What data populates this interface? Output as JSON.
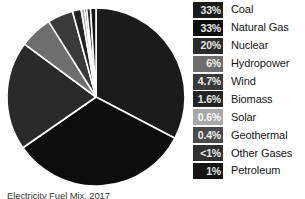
{
  "figure": {
    "caption": "Electricity Fuel Mix, 2017",
    "caption_visible_note": "clipped at image bottom edge"
  },
  "legend": {
    "items": [
      {
        "pct": "33%",
        "label": "Coal",
        "swatch_color": "#1b1b1b",
        "pct_color": "#e8e8e8"
      },
      {
        "pct": "33%",
        "label": "Natural Gas",
        "swatch_color": "#0d0d0d",
        "pct_color": "#ededed"
      },
      {
        "pct": "20%",
        "label": "Nuclear",
        "swatch_color": "#2a2a2a",
        "pct_color": "#e4e4e4"
      },
      {
        "pct": "6%",
        "label": "Hydropower",
        "swatch_color": "#6e6e6e",
        "pct_color": "#f2f2f2"
      },
      {
        "pct": "4.7%",
        "label": "Wind",
        "swatch_color": "#3a3a3a",
        "pct_color": "#ececec"
      },
      {
        "pct": "1.6%",
        "label": "Biomass",
        "swatch_color": "#232323",
        "pct_color": "#e9e9e9"
      },
      {
        "pct": "0.6%",
        "label": "Solar",
        "swatch_color": "#a8a8a8",
        "pct_color": "#fbfbfb"
      },
      {
        "pct": "0.4%",
        "label": "Geothermal",
        "swatch_color": "#4a4a4a",
        "pct_color": "#f0f0f0"
      },
      {
        "pct": "<1%",
        "label": "Other Gases",
        "swatch_color": "#303030",
        "pct_color": "#ebebeb"
      },
      {
        "pct": "1%",
        "label": "Petroleum",
        "swatch_color": "#141414",
        "pct_color": "#e6e6e6"
      }
    ]
  },
  "chart_data": {
    "type": "pie",
    "title": "Electricity Fuel Mix, 2017",
    "xlabel": "",
    "ylabel": "",
    "legend_position": "right",
    "grid": false,
    "start_angle_deg": -90,
    "direction": "clockwise",
    "separator_color": "#ffffff",
    "separator_width_px": 1.6,
    "center": {
      "cx": 91,
      "cy": 89
    },
    "radius": 87,
    "labels": [
      "Coal",
      "Natural Gas",
      "Nuclear",
      "Hydropower",
      "Wind",
      "Biomass",
      "Solar",
      "Geothermal",
      "Other Gases",
      "Petroleum"
    ],
    "values": [
      33,
      33,
      20,
      6,
      4.7,
      1.6,
      0.6,
      0.4,
      0.7,
      1
    ],
    "value_labels": [
      "33%",
      "33%",
      "20%",
      "6%",
      "4.7%",
      "1.6%",
      "0.6%",
      "0.4%",
      "<1%",
      "1%"
    ],
    "colors": [
      "#1b1b1b",
      "#0d0d0d",
      "#2a2a2a",
      "#6e6e6e",
      "#3a3a3a",
      "#232323",
      "#a8a8a8",
      "#4a4a4a",
      "#303030",
      "#141414"
    ],
    "slices": [
      {
        "name": "Coal",
        "value": 33,
        "value_label": "33%",
        "color": "#1b1b1b"
      },
      {
        "name": "Natural Gas",
        "value": 33,
        "value_label": "33%",
        "color": "#0d0d0d"
      },
      {
        "name": "Nuclear",
        "value": 20,
        "value_label": "20%",
        "color": "#2a2a2a"
      },
      {
        "name": "Hydropower",
        "value": 6,
        "value_label": "6%",
        "color": "#6e6e6e"
      },
      {
        "name": "Wind",
        "value": 4.7,
        "value_label": "4.7%",
        "color": "#3a3a3a"
      },
      {
        "name": "Biomass",
        "value": 1.6,
        "value_label": "1.6%",
        "color": "#232323"
      },
      {
        "name": "Solar",
        "value": 0.6,
        "value_label": "0.6%",
        "color": "#a8a8a8"
      },
      {
        "name": "Geothermal",
        "value": 0.4,
        "value_label": "0.4%",
        "color": "#4a4a4a"
      },
      {
        "name": "Other Gases",
        "value": 0.7,
        "value_label": "<1%",
        "color": "#303030"
      },
      {
        "name": "Petroleum",
        "value": 1,
        "value_label": "1%",
        "color": "#141414"
      }
    ]
  }
}
